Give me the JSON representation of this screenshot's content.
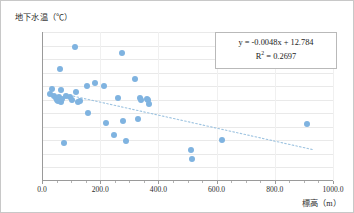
{
  "chart_data": {
    "type": "scatter",
    "title": "",
    "xlabel": "標高（m）",
    "ylabel": "地下水温（℃）",
    "xlim": [
      0.0,
      1000.0
    ],
    "ylim": [
      6.0,
      17.0
    ],
    "xticks": [
      "0.0",
      "200.0",
      "400.0",
      "600.0",
      "800.0",
      "1000.0"
    ],
    "xtick_values": [
      0,
      200,
      400,
      600,
      800,
      1000
    ],
    "yticks": [
      "6.0",
      "7.0",
      "8.0",
      "9.0",
      "10.0",
      "11.0",
      "12.0",
      "13.0",
      "14.0",
      "15.0",
      "16.0",
      "17.0"
    ],
    "ytick_values": [
      6,
      7,
      8,
      9,
      10,
      11,
      12,
      13,
      14,
      15,
      16,
      17
    ],
    "grid": "horizontal",
    "legend": "none",
    "marker_color": "#7fb3e0",
    "trendline": {
      "type": "linear-dotted",
      "color": "#9dc3e0",
      "slope": -0.0048,
      "intercept": 12.784,
      "r_squared": 0.2697,
      "x_start": 95,
      "x_end": 930
    },
    "annotations": {
      "equation": "y = -0.0048x + 12.784",
      "r_squared_label": "R",
      "r_squared_exp": "2",
      "r_squared_value": " = 0.2697"
    },
    "points": [
      {
        "x": 28,
        "y": 12.4
      },
      {
        "x": 36,
        "y": 12.8
      },
      {
        "x": 40,
        "y": 12.3
      },
      {
        "x": 48,
        "y": 12.1
      },
      {
        "x": 52,
        "y": 12.0
      },
      {
        "x": 56,
        "y": 11.9
      },
      {
        "x": 58,
        "y": 12.2
      },
      {
        "x": 62,
        "y": 14.3
      },
      {
        "x": 64,
        "y": 12.75
      },
      {
        "x": 66,
        "y": 11.8
      },
      {
        "x": 70,
        "y": 12.05
      },
      {
        "x": 74,
        "y": 8.8
      },
      {
        "x": 84,
        "y": 12.3
      },
      {
        "x": 96,
        "y": 12.2
      },
      {
        "x": 104,
        "y": 11.95
      },
      {
        "x": 112,
        "y": 15.9
      },
      {
        "x": 118,
        "y": 12.6
      },
      {
        "x": 124,
        "y": 11.85
      },
      {
        "x": 132,
        "y": 11.9
      },
      {
        "x": 156,
        "y": 13.05
      },
      {
        "x": 158,
        "y": 11.05
      },
      {
        "x": 182,
        "y": 13.25
      },
      {
        "x": 212,
        "y": 13.05
      },
      {
        "x": 220,
        "y": 10.3
      },
      {
        "x": 248,
        "y": 9.4
      },
      {
        "x": 262,
        "y": 12.1
      },
      {
        "x": 276,
        "y": 15.45
      },
      {
        "x": 278,
        "y": 10.4
      },
      {
        "x": 288,
        "y": 8.95
      },
      {
        "x": 318,
        "y": 13.55
      },
      {
        "x": 330,
        "y": 10.6
      },
      {
        "x": 336,
        "y": 12.1
      },
      {
        "x": 340,
        "y": 11.95
      },
      {
        "x": 360,
        "y": 12.05
      },
      {
        "x": 364,
        "y": 11.95
      },
      {
        "x": 368,
        "y": 11.7
      },
      {
        "x": 512,
        "y": 8.3
      },
      {
        "x": 514,
        "y": 7.65
      },
      {
        "x": 620,
        "y": 9.05
      },
      {
        "x": 912,
        "y": 10.2
      }
    ]
  }
}
